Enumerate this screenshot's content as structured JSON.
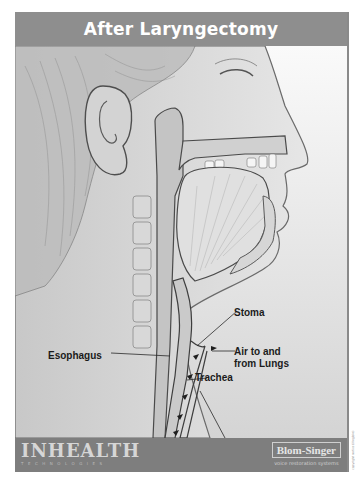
{
  "header": {
    "title": "After Laryngectomy"
  },
  "illustration": {
    "subject": "sagittal cross-section of head and neck after laryngectomy",
    "style": "grayscale pencil medical illustration",
    "colors": {
      "background": "#dcdcdc",
      "header_bar": "#8e8e8e",
      "footer_bar": "#7e7e7e",
      "label_text": "#1b1b1b"
    }
  },
  "labels": {
    "stoma": "Stoma",
    "esophagus": "Esophagus",
    "air_line1": "Air to and",
    "air_line2": "from Lungs",
    "trachea": "Trachea"
  },
  "footer": {
    "brand_name": "INHEALTH",
    "brand_sub": "TECHNOLOGIES",
    "partner_name": "Blom-Singer",
    "partner_sub": "voice restoration systems"
  },
  "side_note": "copyright notice (illegible)"
}
